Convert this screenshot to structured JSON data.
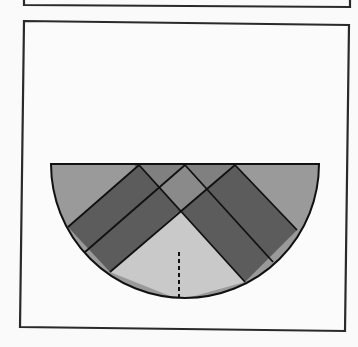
{
  "figure": {
    "type": "geometry-semicircle-crossing-bands",
    "colors": {
      "background": "#fafafa",
      "frame_stroke": "#2a2a2a",
      "outline": "#111111",
      "outer_region": "#9a9a9a",
      "top_triangles": "#808080",
      "band": "#5c5c5c",
      "overlap_diamond": "#8a8a8a",
      "bottom_triangle": "#c9c9c9",
      "dashed_line": "#111111"
    },
    "top_frame": {
      "points": "24,-4 350,-4 350,25 24,21"
    },
    "main_frame": {
      "points": "24,21 349,25 345,331 20,327"
    },
    "semicircle": {
      "left": [
        51,
        164
      ],
      "right": [
        319,
        164
      ],
      "center_x": 185,
      "radius": 134
    },
    "labels": []
  }
}
